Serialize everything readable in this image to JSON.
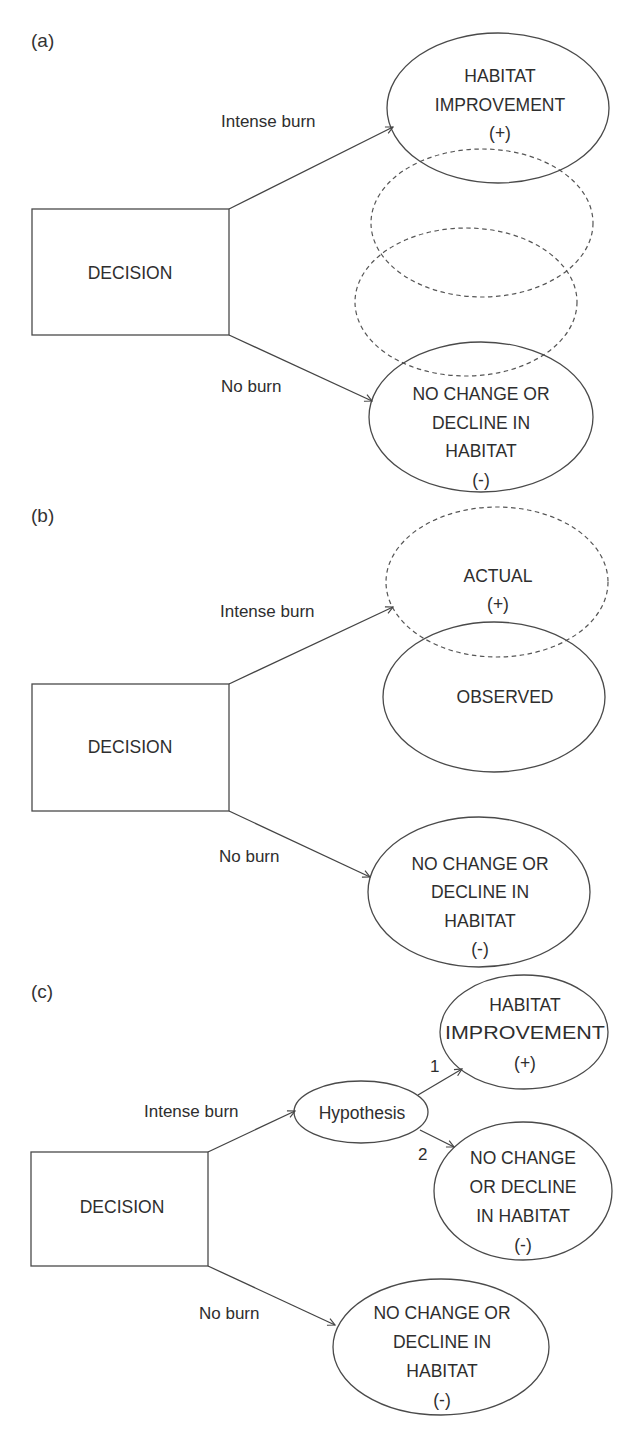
{
  "panels": {
    "a": {
      "label": "(a)",
      "decision": "DECISION",
      "edges": {
        "intense": "Intense burn",
        "none": "No burn"
      },
      "top_outcome": {
        "lines": [
          "HABITAT",
          "IMPROVEMENT",
          "(+)"
        ]
      },
      "bottom_outcome": {
        "lines": [
          "NO CHANGE OR",
          "DECLINE IN",
          "HABITAT",
          "(-)"
        ]
      },
      "uncertain_outcomes": 2
    },
    "b": {
      "label": "(b)",
      "decision": "DECISION",
      "edges": {
        "intense": "Intense burn",
        "none": "No burn"
      },
      "actual": {
        "lines": [
          "ACTUAL",
          "(+)"
        ]
      },
      "observed": {
        "lines": [
          "OBSERVED"
        ]
      },
      "bottom_outcome": {
        "lines": [
          "NO CHANGE OR",
          "DECLINE IN",
          "HABITAT",
          "(-)"
        ]
      }
    },
    "c": {
      "label": "(c)",
      "decision": "DECISION",
      "edges": {
        "intense": "Intense burn",
        "none": "No burn",
        "h1": "1",
        "h2": "2"
      },
      "hypothesis": "Hypothesis",
      "outcome1": {
        "lines": [
          "HABITAT",
          "IMPROVEMENT",
          "(+)"
        ]
      },
      "outcome2": {
        "lines": [
          "NO CHANGE",
          "OR DECLINE",
          "IN HABITAT",
          "(-)"
        ]
      },
      "bottom_outcome": {
        "lines": [
          "NO CHANGE OR",
          "DECLINE IN",
          "HABITAT",
          "(-)"
        ]
      }
    }
  },
  "colors": {
    "stroke": "#4a4a4a",
    "text": "#2e2e2e",
    "background": "#ffffff"
  }
}
